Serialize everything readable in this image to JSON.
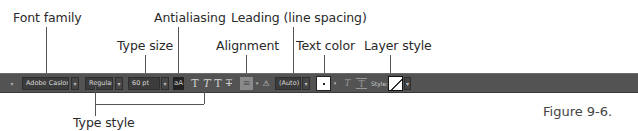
{
  "figure": {
    "caption": "Figure 9-6."
  },
  "callouts": {
    "font_family": "Font family",
    "antialiasing": "Antialiasing",
    "leading": "Leading (line spacing)",
    "type_size": "Type size",
    "alignment": "Alignment",
    "text_color": "Text color",
    "layer_style": "Layer style",
    "type_style": "Type style"
  },
  "toolbar": {
    "tool_preset_arrow": "▾",
    "font_family_value": "Adobe Caslon ...",
    "font_style_value": "Regular",
    "font_size_value": "60 pt",
    "antialiasing_icon": "aA",
    "type_style_buttons": [
      "T",
      "T",
      "T",
      "T"
    ],
    "alignment_icon": "≡",
    "warp_icon": "⚠",
    "leading_value": "(Auto)",
    "text_color": "#ffffff",
    "style_label": "Style:",
    "dropdown_arrow": "▾",
    "baseline_icon": "T",
    "frame_icon": "T"
  },
  "colors": {
    "toolbar_bg": "#535353",
    "field_bg": "#3c3c3c",
    "text_swatch": "#ffffff"
  }
}
